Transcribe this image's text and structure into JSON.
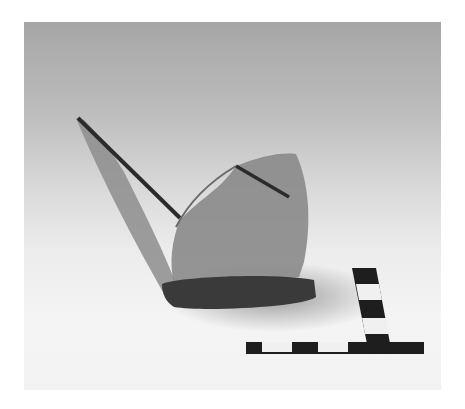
{
  "image": {
    "subject": "Fragmented glass vessel with scale bar",
    "colors": {
      "background_top": "#a6a6a6",
      "background_bottom": "#f2f2f2",
      "glass": "#8a8a8a",
      "scale_dark": "#1e1e1e",
      "scale_light": "#f0f0f0"
    }
  }
}
